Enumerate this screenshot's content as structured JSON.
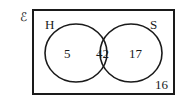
{
  "venn": {
    "universal_symbol": "ℰ",
    "sets": [
      {
        "name": "H"
      },
      {
        "name": "S"
      }
    ],
    "regions": {
      "only_H": "5",
      "H_and_S": "42",
      "only_S": "17",
      "neither": "16"
    }
  },
  "colors": {
    "stroke": "#1a1a1a",
    "background": "#ffffff"
  }
}
